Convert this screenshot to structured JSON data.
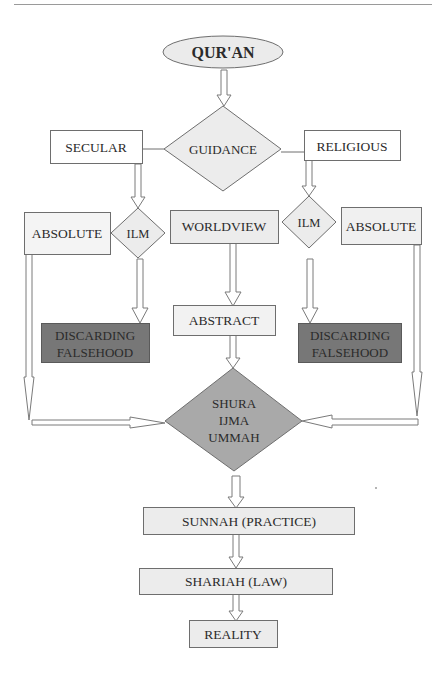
{
  "header": {
    "running_text": ""
  },
  "diagram": {
    "nodes": {
      "quran": {
        "label": "QUR'AN",
        "shape": "ellipse",
        "fill": "#ebebeb"
      },
      "guidance": {
        "label": "GUIDANCE",
        "shape": "diamond",
        "fill": "#ececec"
      },
      "secular": {
        "label": "SECULAR",
        "shape": "rect",
        "fill": "#ffffff"
      },
      "religious": {
        "label": "RELIGIOUS",
        "shape": "rect",
        "fill": "#ffffff"
      },
      "absolute_left": {
        "label": "ABSOLUTE",
        "shape": "rect",
        "fill": "#f4f4f4"
      },
      "ilm_left": {
        "label": "ILM",
        "shape": "diamond",
        "fill": "#ececec"
      },
      "worldview": {
        "label": "WORLDVIEW",
        "shape": "rect",
        "fill": "#ececec"
      },
      "ilm_right": {
        "label": "ILM",
        "shape": "diamond",
        "fill": "#ececec"
      },
      "absolute_right": {
        "label": "ABSOLUTE",
        "shape": "rect",
        "fill": "#f0f0f0"
      },
      "discarding_left": {
        "line1": "DISCARDING",
        "line2": "FALSEHOOD",
        "shape": "rect",
        "fill": "#777777"
      },
      "abstract": {
        "label": "ABSTRACT",
        "shape": "rect",
        "fill": "#f2f2f2"
      },
      "discarding_right": {
        "line1": "DISCARDING",
        "line2": "FALSEHOOD",
        "shape": "rect",
        "fill": "#777777"
      },
      "shura": {
        "line1": "SHURA",
        "line2": "IJMA",
        "line3": "UMMAH",
        "shape": "diamond",
        "fill": "#a9a9a9"
      },
      "sunnah": {
        "label": "SUNNAH (PRACTICE)",
        "shape": "rect",
        "fill": "#ececec"
      },
      "shariah": {
        "label": "SHARIAH (LAW)",
        "shape": "rect",
        "fill": "#ececec"
      },
      "reality": {
        "label": "REALITY",
        "shape": "rect",
        "fill": "#ececec"
      }
    },
    "edges": [
      {
        "from": "QUR'AN",
        "to": "GUIDANCE",
        "type": "block-arrow"
      },
      {
        "from": "GUIDANCE",
        "to": "SECULAR",
        "type": "line"
      },
      {
        "from": "GUIDANCE",
        "to": "RELIGIOUS",
        "type": "line"
      },
      {
        "from": "SECULAR",
        "to": "ILM (left)",
        "type": "block-arrow"
      },
      {
        "from": "RELIGIOUS",
        "to": "ILM (right)",
        "type": "block-arrow"
      },
      {
        "from": "ILM (left)",
        "to": "DISCARDING FALSEHOOD (left)",
        "type": "block-arrow"
      },
      {
        "from": "ILM (right)",
        "to": "DISCARDING FALSEHOOD (right)",
        "type": "block-arrow"
      },
      {
        "from": "WORLDVIEW",
        "to": "ABSTRACT",
        "type": "block-arrow"
      },
      {
        "from": "ABSTRACT",
        "to": "SHURA IJMA UMMAH",
        "type": "block-arrow"
      },
      {
        "from": "ABSOLUTE (left)",
        "to": "SHURA IJMA UMMAH",
        "type": "block-arrow"
      },
      {
        "from": "ABSOLUTE (right)",
        "to": "SHURA IJMA UMMAH",
        "type": "block-arrow"
      },
      {
        "from": "SHURA IJMA UMMAH",
        "to": "SUNNAH (PRACTICE)",
        "type": "block-arrow"
      },
      {
        "from": "SUNNAH (PRACTICE)",
        "to": "SHARIAH (LAW)",
        "type": "block-arrow"
      },
      {
        "from": "SHARIAH (LAW)",
        "to": "REALITY",
        "type": "block-arrow"
      }
    ],
    "colors": {
      "stroke": "#6e6e6e",
      "text": "#2b2b2b",
      "dark_fill": "#777777",
      "mid_fill": "#a9a9a9",
      "light_fill": "#ececec"
    }
  }
}
